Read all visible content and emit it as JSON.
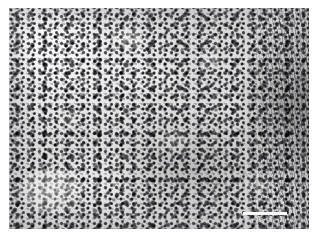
{
  "figure": {
    "kind": "histopathology-micrograph",
    "staining": "H&E",
    "rendering": "grayscale"
  },
  "plate": {
    "background_color": "#e6e6e6",
    "border_color": "#ffffff",
    "dark_nuclei_color": "#232328",
    "mid_tone_color": "#b4b4b4",
    "pale_tone_color": "#f2f2f2"
  },
  "regions": [
    {
      "name": "lymphoid-field-left",
      "description": "Densely packed small dark round nuclei on pale background"
    },
    {
      "name": "lymphoid-field-center",
      "description": "Mixed density nuclei with scattered pale clearings"
    },
    {
      "name": "fibrous-band-right",
      "description": "Darker elongated streaming fibrillar stromal tissue along right edge"
    },
    {
      "name": "pale-nodule-lower-left",
      "description": "Rounded pale nodular follicle-like structure"
    }
  ],
  "annotations": {
    "scale_bar": {
      "visible": true,
      "label": "50 µm",
      "position": "bottom-right"
    },
    "watermark": {
      "visible": true,
      "text": "· · · · · · · · · · · · · ·",
      "position": "bottom-right",
      "legible": false
    }
  }
}
